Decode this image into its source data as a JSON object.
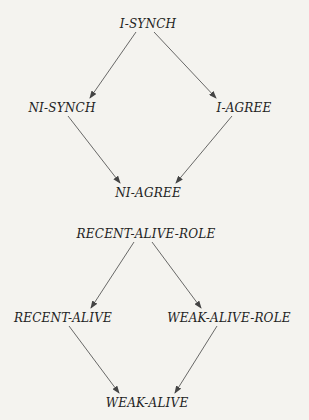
{
  "diagrams": [
    {
      "nodes": [
        {
          "id": "i-synch",
          "label": "I-SYNCH",
          "x": 148,
          "y": 24
        },
        {
          "id": "ni-synch",
          "label": "NI-SYNCH",
          "x": 62,
          "y": 108
        },
        {
          "id": "i-agree",
          "label": "I-AGREE",
          "x": 244,
          "y": 108
        },
        {
          "id": "ni-agree",
          "label": "NI-AGREE",
          "x": 148,
          "y": 193
        }
      ],
      "edges": [
        {
          "from": "i-synch",
          "to": "ni-synch"
        },
        {
          "from": "i-synch",
          "to": "i-agree"
        },
        {
          "from": "ni-synch",
          "to": "ni-agree"
        },
        {
          "from": "i-agree",
          "to": "ni-agree"
        }
      ]
    },
    {
      "nodes": [
        {
          "id": "recent-alive-role",
          "label": "RECENT-ALIVE-ROLE",
          "x": 146,
          "y": 234
        },
        {
          "id": "recent-alive",
          "label": "RECENT-ALIVE",
          "x": 63,
          "y": 318
        },
        {
          "id": "weak-alive-role",
          "label": "WEAK-ALIVE-ROLE",
          "x": 229,
          "y": 318
        },
        {
          "id": "weak-alive",
          "label": "WEAK-ALIVE",
          "x": 147,
          "y": 403
        }
      ],
      "edges": [
        {
          "from": "recent-alive-role",
          "to": "recent-alive"
        },
        {
          "from": "recent-alive-role",
          "to": "weak-alive-role"
        },
        {
          "from": "recent-alive",
          "to": "weak-alive"
        },
        {
          "from": "weak-alive-role",
          "to": "weak-alive"
        }
      ]
    }
  ],
  "colors": {
    "line": "#444444",
    "text": "#222222",
    "background": "#f4f3ef"
  }
}
